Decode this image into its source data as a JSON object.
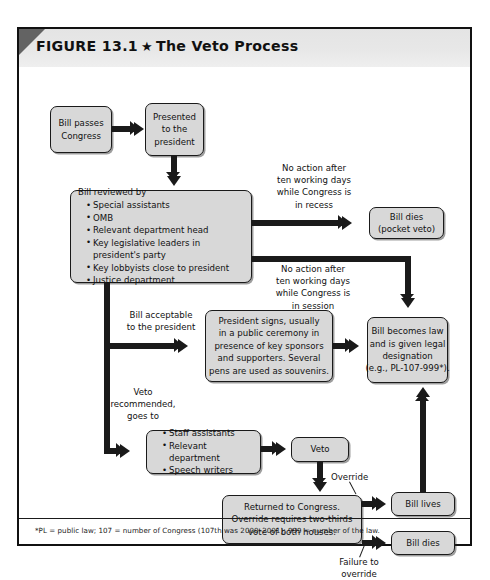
{
  "figure": {
    "label": "FIGURE 13.1",
    "star": "★",
    "title": "The Veto Process",
    "footnote": "*PL = public law; 107 = number of Congress (107th was 2000–2001); 999 = number of the law."
  },
  "nodes": {
    "bill_passes": {
      "lines": [
        "Bill passes",
        "Congress"
      ]
    },
    "presented": {
      "lines": [
        "Presented",
        "to the",
        "president"
      ]
    },
    "reviewed": {
      "heading": "Bill reviewed by",
      "items": [
        "Special assistants",
        "OMB",
        "Relevant department head",
        "Key legislative leaders in president's party",
        "Key lobbyists close to president",
        "Justice department"
      ]
    },
    "pocket_veto": {
      "lines": [
        "Bill dies",
        "(pocket veto)"
      ]
    },
    "becomes_law": {
      "lines": [
        "Bill becomes law",
        "and is given legal",
        "designation",
        "(e.g., PL-107-999*)."
      ]
    },
    "president_signs": {
      "lines": [
        "President signs, usually",
        "in a public ceremony in",
        "presence of key sponsors",
        "and supporters. Several",
        "pens are used as souvenirs."
      ]
    },
    "staff": {
      "items": [
        "Staff assistants",
        "Relevant department",
        "Speech writers"
      ]
    },
    "veto": {
      "lines": [
        "Veto"
      ]
    },
    "returned": {
      "lines": [
        "Returned to Congress.",
        "Override requires two-thirds",
        "vote of both houses."
      ]
    },
    "bill_lives": {
      "lines": [
        "Bill lives"
      ]
    },
    "bill_dies": {
      "lines": [
        "Bill dies"
      ]
    }
  },
  "edge_labels": {
    "recess": "No action after\nten working days\nwhile Congress is\nin recess",
    "session": "No action after\nten working days\nwhile Congress is\nin session",
    "acceptable": "Bill acceptable\nto the president",
    "veto_recommended": "Veto\nrecommended,\ngoes to",
    "override": "Override",
    "failure": "Failure to\noverride"
  },
  "colors": {
    "box_fill": "#d8d8d8",
    "box_stroke": "#1a1a1a",
    "header_band": "#e8e8e8",
    "corner_fold": "#636363",
    "frame": "#111111",
    "page": "#ffffff"
  }
}
